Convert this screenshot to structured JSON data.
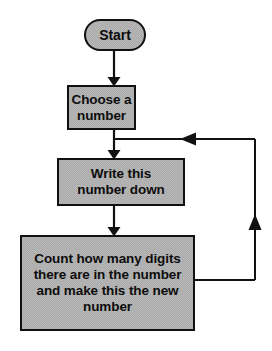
{
  "diagram": {
    "background_color": "#ffffff",
    "node_fill_color": "#ababab",
    "node_border_color": "#111111",
    "text_color": "#0d0d0d",
    "connector_color": "#111111"
  },
  "nodes": {
    "start": {
      "label": "Start",
      "shape": "stadium"
    },
    "choose": {
      "label": "Choose a\nnumber",
      "shape": "rectangle"
    },
    "write": {
      "label": "Write this\nnumber down",
      "shape": "rectangle"
    },
    "count": {
      "label": "Count how many digits\nthere are in the number\nand make this the new\nnumber",
      "shape": "rectangle"
    }
  },
  "connectors": [
    {
      "name": "start-to-choose",
      "from": "start",
      "to": "choose",
      "direction": "down",
      "arrowhead": "filled-triangle"
    },
    {
      "name": "choose-to-write",
      "from": "choose",
      "to": "write",
      "direction": "down",
      "arrowhead": "filled-triangle"
    },
    {
      "name": "write-to-count",
      "from": "write",
      "to": "count",
      "direction": "down",
      "arrowhead": "filled-triangle"
    },
    {
      "name": "count-loop-back-to-write",
      "from": "count",
      "to": "write",
      "direction": "loop-right-up-left",
      "arrowhead": "filled-triangle"
    }
  ]
}
